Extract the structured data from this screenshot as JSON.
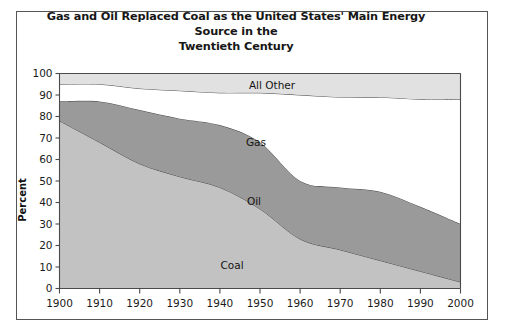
{
  "figure": {
    "title_line1": "Gas and Oil Replaced Coal as the United States' Main Energy Source in the",
    "title_line2": "Twentieth Century"
  },
  "axes": {
    "ylabel": "Percent",
    "yticks": [
      "0",
      "10",
      "20",
      "30",
      "40",
      "50",
      "60",
      "70",
      "80",
      "90",
      "100"
    ],
    "xticks": [
      "1900",
      "1910",
      "1920",
      "1930",
      "1940",
      "1950",
      "1960",
      "1970",
      "1980",
      "1990",
      "2000"
    ]
  },
  "series_labels": {
    "all_other": "All Other",
    "gas": "Gas",
    "oil": "Oil",
    "coal": "Coal"
  },
  "colors": {
    "coal": "#c2c2c2",
    "oil": "#9a9a9a",
    "gas": "#ffffff",
    "all_other": "#e1e1e1",
    "outline": "#3a3a3a",
    "axis": "#4a4a4a",
    "text": "#161616",
    "frame": "#555555"
  },
  "chart_data": {
    "type": "area",
    "stacked": true,
    "title": "Gas and Oil Replaced Coal as the United States' Main Energy Source in the Twentieth Century",
    "xlabel": "",
    "ylabel": "Percent",
    "xlim": [
      1900,
      2000
    ],
    "ylim": [
      0,
      100
    ],
    "grid": false,
    "legend": "inline-area-labels",
    "x": [
      1900,
      1910,
      1920,
      1930,
      1940,
      1950,
      1960,
      1970,
      1980,
      1990,
      2000
    ],
    "categories": [
      "1900",
      "1910",
      "1920",
      "1930",
      "1940",
      "1950",
      "1960",
      "1970",
      "1980",
      "1990",
      "2000"
    ],
    "series": [
      {
        "name": "Coal",
        "color": "#c2c2c2",
        "values": [
          78,
          68,
          58,
          52,
          47,
          37,
          23,
          18,
          13,
          8,
          3
        ],
        "cumulative_top": [
          78,
          68,
          58,
          52,
          47,
          37,
          23,
          18,
          13,
          8,
          3
        ]
      },
      {
        "name": "Oil",
        "color": "#9a9a9a",
        "values": [
          9,
          19,
          25,
          27,
          29,
          31,
          27,
          29,
          32,
          30,
          27
        ],
        "cumulative_top": [
          87,
          87,
          83,
          79,
          76,
          68,
          50,
          47,
          45,
          38,
          30
        ]
      },
      {
        "name": "Gas",
        "color": "#ffffff",
        "values": [
          8,
          8,
          10,
          13,
          15,
          23,
          40,
          42,
          44,
          50,
          58
        ],
        "cumulative_top": [
          95,
          95,
          93,
          92,
          91,
          91,
          90,
          89,
          89,
          88,
          88
        ]
      },
      {
        "name": "All Other",
        "color": "#e1e1e1",
        "values": [
          5,
          5,
          7,
          8,
          9,
          9,
          10,
          11,
          11,
          12,
          12
        ],
        "cumulative_top": [
          100,
          100,
          100,
          100,
          100,
          100,
          100,
          100,
          100,
          100,
          100
        ]
      }
    ]
  }
}
